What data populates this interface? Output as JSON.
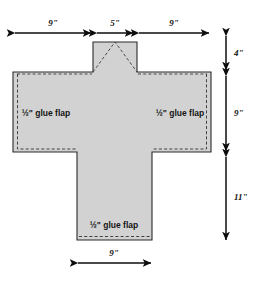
{
  "diagram": {
    "type": "packaging-net-dieline",
    "fill_color": "#d2d2d2",
    "outline_color": "#2b2b2b",
    "dash_color": "#3a3a3a",
    "dimension_color": "#0d0d0d",
    "background_color": "#ffffff"
  },
  "dimensions": {
    "top": [
      {
        "id": "top-left",
        "label": "9\"",
        "orientation": "horizontal"
      },
      {
        "id": "top-center",
        "label": "5\"",
        "orientation": "horizontal"
      },
      {
        "id": "top-right",
        "label": "9\"",
        "orientation": "horizontal"
      }
    ],
    "right": [
      {
        "id": "right-upper",
        "label": "4\"",
        "orientation": "vertical"
      },
      {
        "id": "right-middle",
        "label": "9\"",
        "orientation": "vertical"
      },
      {
        "id": "right-lower",
        "label": "11\"",
        "orientation": "vertical"
      }
    ],
    "bottom": [
      {
        "id": "bottom-center",
        "label": "9\"",
        "orientation": "horizontal"
      }
    ]
  },
  "labels": {
    "glue_flap_left": "½\" glue flap",
    "glue_flap_right": "½\" glue flap",
    "glue_flap_bottom": "½\" glue flap"
  }
}
